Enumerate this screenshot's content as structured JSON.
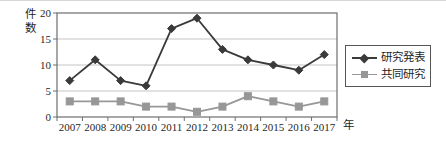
{
  "figure": {
    "background": "#ffffff",
    "top_border_color": "#d8d8d8"
  },
  "chart_data": {
    "type": "line",
    "title": "",
    "ylabel": "件数",
    "xlabel": "年",
    "categories": [
      "2007",
      "2008",
      "2009",
      "2010",
      "2011",
      "2012",
      "2013",
      "2014",
      "2015",
      "2016",
      "2017"
    ],
    "yticks": [
      0,
      5,
      10,
      15,
      20
    ],
    "ylim": [
      0,
      20
    ],
    "grid": "horizontal",
    "legend_position": "right",
    "axis_color": "#6e6e6e",
    "gridline_color": "#c4c4c4",
    "tick_label_color": "#1f1f1f",
    "series": [
      {
        "name": "研究発表",
        "marker": "diamond",
        "color": "#3a3a3a",
        "values": [
          7,
          11,
          7,
          6,
          17,
          19,
          13,
          11,
          10,
          9,
          12
        ]
      },
      {
        "name": "共同研究",
        "marker": "square",
        "color": "#979797",
        "values": [
          3,
          3,
          3,
          2,
          2,
          1,
          2,
          4,
          3,
          2,
          3
        ]
      }
    ]
  }
}
